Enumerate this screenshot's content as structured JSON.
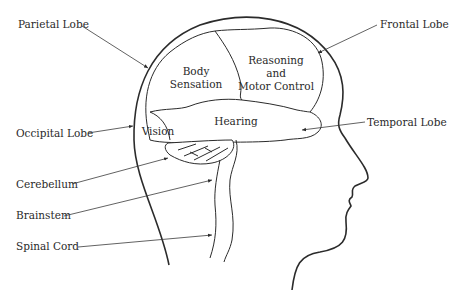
{
  "diagram": {
    "outer_labels": {
      "parietal": "Parietal Lobe",
      "frontal": "Frontal Lobe",
      "occipital": "Occipital Lobe",
      "temporal": "Temporal Lobe",
      "cerebellum": "Cerebellum",
      "brainstem": "Brainstem",
      "spinal_cord": "Spinal Cord"
    },
    "region_labels": {
      "body_sensation_1": "Body",
      "body_sensation_2": "Sensation",
      "reasoning_1": "Reasoning",
      "reasoning_2": "and",
      "reasoning_3": "Motor Control",
      "hearing": "Hearing",
      "vision": "Vision"
    },
    "colors": {
      "line": "#2b2b2b",
      "text": "#2a2a2a",
      "background": "#ffffff"
    }
  }
}
